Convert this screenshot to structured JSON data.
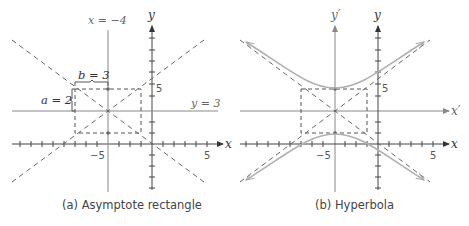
{
  "panels": [
    {
      "id": "a",
      "caption": "(a) Asymptote rectangle",
      "labels": {
        "vertical_line": "x = −4",
        "horizontal_line": "y = 3",
        "b_label": "b = 3",
        "a_label": "a = 2",
        "y_axis": "y",
        "x_axis": "x",
        "tick_y5": "5",
        "tick_xm5": "−5",
        "tick_x5": "5"
      }
    },
    {
      "id": "b",
      "caption": "(b) Hyperbola",
      "labels": {
        "y_prime_axis": "y′",
        "x_prime_axis": "x′",
        "y_axis": "y",
        "x_axis": "x",
        "tick_y5": "5",
        "tick_xm5": "−5",
        "tick_x5": "5"
      }
    }
  ],
  "hyperbola": {
    "equation": "(y-3)^2/4 - (x+4)^2/9 = 1",
    "center": [
      -4,
      3
    ],
    "a": 2,
    "b": 3
  },
  "colors": {
    "axis": "#555555",
    "dashed": "#666666",
    "curve": "#b0b0b0"
  }
}
